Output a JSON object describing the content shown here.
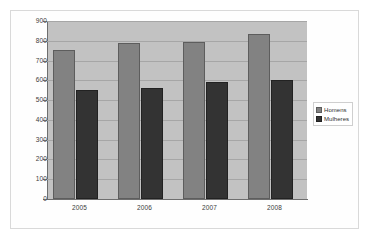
{
  "figure": {
    "background_color": "#ffffff",
    "frame_color": "#d9d9d9"
  },
  "chart_data": {
    "type": "bar",
    "title": "",
    "subtitle": "",
    "xlabel": "",
    "ylabel": "",
    "categories": [
      "2005",
      "2006",
      "2007",
      "2008"
    ],
    "series": [
      {
        "name": "Homens",
        "values": [
          755,
          790,
          795,
          835
        ],
        "color": "#828282"
      },
      {
        "name": "Mulheres",
        "values": [
          550,
          560,
          590,
          600
        ],
        "color": "#333333"
      }
    ],
    "ylim": [
      0,
      900
    ],
    "ytick_step": 100,
    "yticks": [
      "900",
      "800",
      "700",
      "600",
      "500",
      "400",
      "300",
      "200",
      "100",
      "0"
    ],
    "grid": true,
    "grid_axis": "y",
    "legend_position": "right",
    "plot_background_color": "#c2c2c2",
    "gridline_color": "#a6a6a6",
    "axis_color": "#6e6e6e"
  },
  "legend": {
    "entries": [
      {
        "label": "Homens"
      },
      {
        "label": "Mulheres"
      }
    ]
  }
}
